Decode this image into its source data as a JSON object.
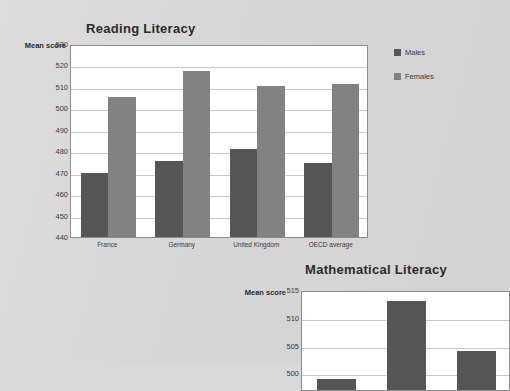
{
  "theme": {
    "page_background": "#d9d9d9",
    "plot_background": "#ffffff",
    "males_color": "#565656",
    "females_color": "#828282",
    "gridline_color": "#c9c9c9",
    "axis_color": "#8c8c8c",
    "title_color": "#2b2b2b"
  },
  "legend": {
    "items": [
      {
        "label": "Males",
        "color": "#565656",
        "swatch": "legend-swatch-males"
      },
      {
        "label": "Females",
        "color": "#828282",
        "swatch": "legend-swatch-females"
      }
    ]
  },
  "chart_data": [
    {
      "id": "reading-literacy",
      "type": "bar",
      "title": "Reading Literacy",
      "ylabel": "Mean score",
      "xlabel": "",
      "ylim": [
        440,
        530
      ],
      "yticks": [
        530,
        520,
        510,
        500,
        490,
        480,
        470,
        460,
        450,
        440
      ],
      "grid": true,
      "legend_position": "right",
      "categories": [
        "France",
        "Germany",
        "United Kingdom",
        "OECD average"
      ],
      "series": [
        {
          "name": "Males",
          "color": "#565656",
          "values": [
            470.0,
            475.5,
            481.0,
            474.5
          ]
        },
        {
          "name": "Females",
          "color": "#828282",
          "values": [
            505.5,
            517.5,
            510.5,
            511.5
          ]
        }
      ]
    },
    {
      "id": "mathematical-literacy",
      "type": "bar",
      "title": "Mathematical Literacy",
      "ylabel": "Mean score",
      "xlabel": "",
      "ylim": [
        497,
        515
      ],
      "yticks": [
        515,
        510,
        505,
        500
      ],
      "grid": true,
      "legend_position": "none",
      "note": "chart is cropped at the bottom and right edge of the screenshot",
      "categories": [
        "France",
        "Germany",
        "United Kingdom"
      ],
      "series": [
        {
          "name": "Males",
          "color": "#565656",
          "values": [
            499.0,
            513.0,
            504.0
          ]
        }
      ]
    }
  ]
}
